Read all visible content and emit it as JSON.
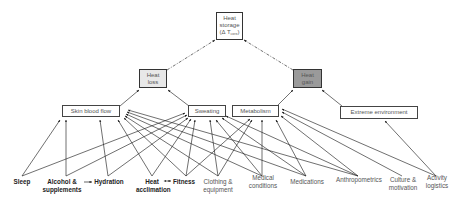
{
  "nodes": {
    "heat_storage": {
      "line1": "Heat",
      "line2": "storage",
      "line3_prefix": "(Δ T",
      "line3_sub": "core",
      "line3_suffix": ")",
      "fill": "#ffffff"
    },
    "heat_loss": {
      "line1": "Heat",
      "line2": "loss",
      "fill": "#e8e8e8"
    },
    "heat_gain": {
      "line1": "Heat",
      "line2": "gain",
      "fill": "#9a9a9a"
    },
    "skin_blood_flow": {
      "label": "Skin blood flow",
      "fill": "#ffffff"
    },
    "sweating": {
      "label": "Sweating",
      "fill": "#ffffff"
    },
    "metabolism": {
      "label": "Metabolism",
      "fill": "#ffffff"
    },
    "extreme_environment": {
      "label": "Extreme environment",
      "fill": "#ffffff"
    }
  },
  "factors": [
    {
      "id": "sleep",
      "line1": "Sleep",
      "line2": "",
      "bold": true
    },
    {
      "id": "alcohol",
      "line1": "Alcohol &",
      "line2": "supplements",
      "bold": true
    },
    {
      "id": "hydration",
      "line1": "Hydration",
      "line2": "",
      "bold": true
    },
    {
      "id": "heat_acclimation",
      "line1": "Heat",
      "line2": "acclimation",
      "bold": true
    },
    {
      "id": "fitness",
      "line1": "Fitness",
      "line2": "",
      "bold": true
    },
    {
      "id": "clothing",
      "line1": "Clothing &",
      "line2": "equipment",
      "bold": false
    },
    {
      "id": "medical",
      "line1": "Medical",
      "line2": "conditions",
      "bold": false
    },
    {
      "id": "medications",
      "line1": "Medications",
      "line2": "",
      "bold": false
    },
    {
      "id": "anthropometrics",
      "line1": "Anthropometrics",
      "line2": "",
      "bold": false
    },
    {
      "id": "culture",
      "line1": "Culture &",
      "line2": "motivation",
      "bold": false
    },
    {
      "id": "activity",
      "line1": "Activity",
      "line2": "logistics",
      "bold": false
    }
  ],
  "edges": {
    "dashed": [
      [
        "heat_loss",
        "heat_storage"
      ],
      [
        "heat_gain",
        "heat_storage"
      ]
    ],
    "solid_upper": [
      [
        "skin_blood_flow",
        "heat_loss"
      ],
      [
        "sweating",
        "heat_loss"
      ],
      [
        "metabolism",
        "heat_gain"
      ],
      [
        "extreme_environment",
        "heat_gain"
      ]
    ],
    "factor_links": [
      [
        "sleep",
        "skin_blood_flow"
      ],
      [
        "sleep",
        "sweating"
      ],
      [
        "alcohol",
        "skin_blood_flow"
      ],
      [
        "alcohol",
        "sweating"
      ],
      [
        "hydration",
        "skin_blood_flow"
      ],
      [
        "hydration",
        "sweating"
      ],
      [
        "heat_acclimation",
        "skin_blood_flow"
      ],
      [
        "heat_acclimation",
        "sweating"
      ],
      [
        "fitness",
        "skin_blood_flow"
      ],
      [
        "fitness",
        "sweating"
      ],
      [
        "fitness",
        "metabolism"
      ],
      [
        "clothing",
        "skin_blood_flow"
      ],
      [
        "clothing",
        "sweating"
      ],
      [
        "clothing",
        "metabolism"
      ],
      [
        "medical",
        "skin_blood_flow"
      ],
      [
        "medical",
        "sweating"
      ],
      [
        "medical",
        "metabolism"
      ],
      [
        "medications",
        "skin_blood_flow"
      ],
      [
        "medications",
        "sweating"
      ],
      [
        "medications",
        "metabolism"
      ],
      [
        "anthropometrics",
        "skin_blood_flow"
      ],
      [
        "anthropometrics",
        "sweating"
      ],
      [
        "anthropometrics",
        "metabolism"
      ],
      [
        "culture",
        "metabolism"
      ],
      [
        "activity",
        "metabolism"
      ],
      [
        "activity",
        "extreme_environment"
      ]
    ],
    "factor_to_factor": [
      [
        "alcohol",
        "hydration",
        "one-way"
      ],
      [
        "heat_acclimation",
        "fitness",
        "two-way"
      ]
    ]
  }
}
